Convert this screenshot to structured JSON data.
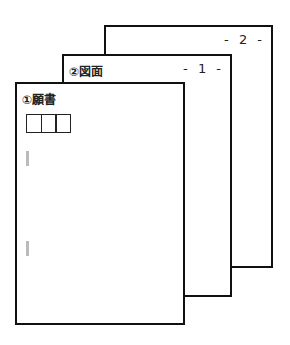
{
  "pages": [
    {
      "id": "page3",
      "page_number": "- 2 -",
      "title": ""
    },
    {
      "id": "page2",
      "page_number": "- 1 -",
      "title": "②図面"
    },
    {
      "id": "page1",
      "page_number": "",
      "title": "①願書",
      "boxes": 3,
      "marks": 2
    }
  ],
  "colors": {
    "border": "#111111",
    "background": "#ffffff",
    "mark": "#bbbbbb"
  }
}
